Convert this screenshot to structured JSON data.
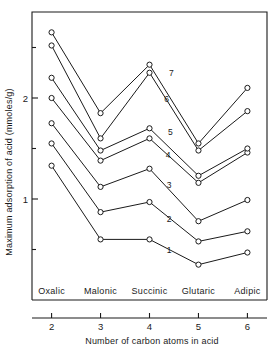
{
  "chart_data": {
    "type": "line",
    "title": "",
    "xlabel": "Number of carbon atoms in acid",
    "ylabel": "Maximum adsorption of acid (mmoles/g)",
    "x": [
      2,
      3,
      4,
      5,
      6
    ],
    "categories": [
      "Oxalic",
      "Malonic",
      "Succinic",
      "Glutaric",
      "Adipic"
    ],
    "xtick_labels": [
      "2",
      "3",
      "4",
      "5",
      "6"
    ],
    "ytick_labels": [
      "1",
      "2"
    ],
    "ytick_values": [
      1,
      2
    ],
    "yminor_ticks": [
      0.5,
      1.5,
      2.5
    ],
    "xlim": [
      1.6,
      6.4
    ],
    "ylim": [
      0.2,
      2.85
    ],
    "grid": false,
    "legend": "inline-series-numbers",
    "marker": "open-circle",
    "series": [
      {
        "name": "1",
        "label": "1",
        "values": [
          1.33,
          0.6,
          0.6,
          0.35,
          0.47
        ],
        "label_x": 4.35,
        "label_y": 0.5
      },
      {
        "name": "2",
        "label": "2",
        "values": [
          1.55,
          0.87,
          0.97,
          0.58,
          0.68
        ],
        "label_x": 4.35,
        "label_y": 0.8
      },
      {
        "name": "3",
        "label": "3",
        "values": [
          1.75,
          1.12,
          1.3,
          0.78,
          0.99
        ],
        "label_x": 4.35,
        "label_y": 1.14
      },
      {
        "name": "4",
        "label": "4",
        "values": [
          2.0,
          1.38,
          1.6,
          1.16,
          1.46
        ],
        "label_x": 4.33,
        "label_y": 1.44
      },
      {
        "name": "5",
        "label": "5",
        "values": [
          2.2,
          1.48,
          1.7,
          1.23,
          1.5
        ],
        "label_x": 4.38,
        "label_y": 1.66
      },
      {
        "name": "6",
        "label": "6",
        "values": [
          2.52,
          1.6,
          2.25,
          1.48,
          1.87
        ],
        "label_x": 4.3,
        "label_y": 1.99
      },
      {
        "name": "7",
        "label": "7",
        "values": [
          2.65,
          1.85,
          2.33,
          1.55,
          2.1
        ],
        "label_x": 4.4,
        "label_y": 2.25
      }
    ]
  },
  "figure": {
    "frame_color": "#1a1a1a",
    "background": "#ffffff",
    "line_color": "#1a1a1a",
    "marker_fill": "#ffffff"
  }
}
